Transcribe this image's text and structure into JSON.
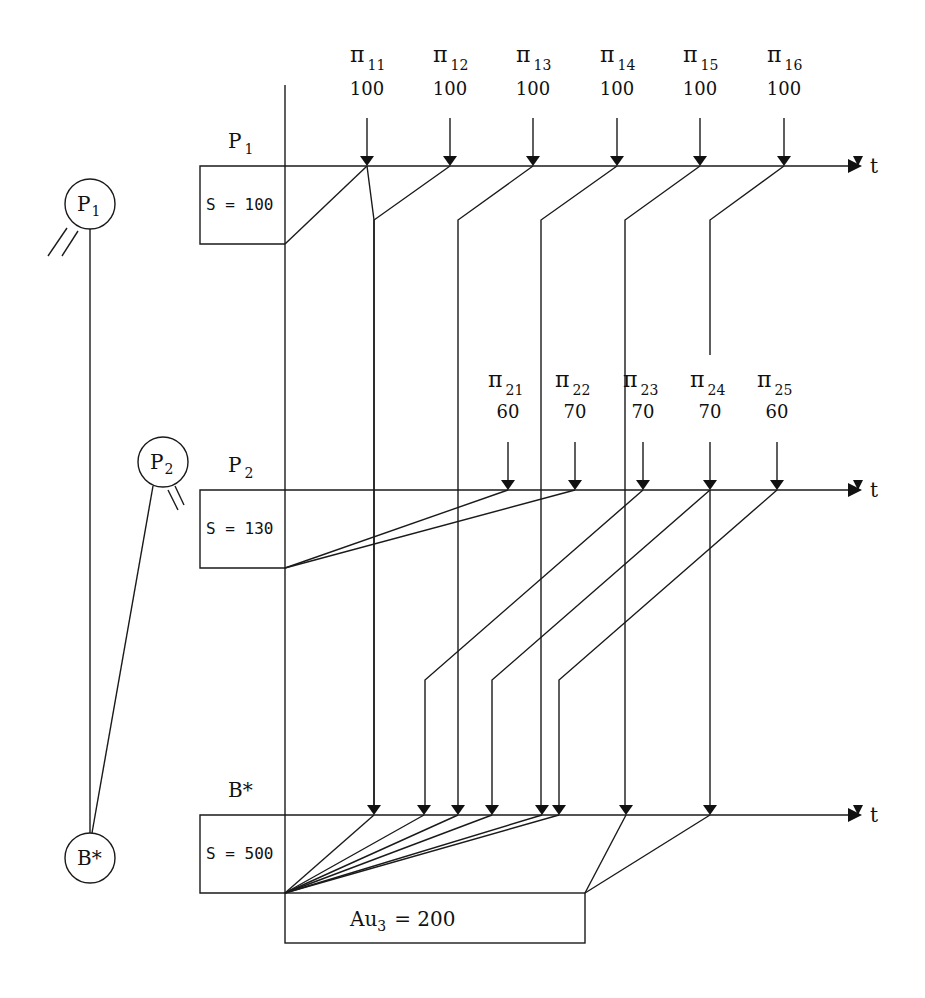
{
  "diagram": {
    "type": "payment-flow-timeline",
    "time_axis_label": "t",
    "nodes": [
      {
        "id": "P1",
        "label": "P",
        "sub": "1",
        "cx": 90,
        "cy": 204,
        "r": 25
      },
      {
        "id": "P2",
        "label": "P",
        "sub": "2",
        "cx": 163,
        "cy": 462,
        "r": 25
      },
      {
        "id": "B*",
        "label": "B*",
        "sub": "",
        "cx": 90,
        "cy": 858,
        "r": 25
      }
    ],
    "lanes": [
      {
        "id": "P1",
        "label": "P",
        "sub": "1",
        "y": 166,
        "stock_label": "S = 100",
        "stock_box": {
          "x": 200,
          "y": 166,
          "w": 85,
          "h": 78
        },
        "payments": [
          {
            "name": "π",
            "sub": "11",
            "value": "100",
            "x": 367
          },
          {
            "name": "π",
            "sub": "12",
            "value": "100",
            "x": 450
          },
          {
            "name": "π",
            "sub": "13",
            "value": "100",
            "x": 533
          },
          {
            "name": "π",
            "sub": "14",
            "value": "100",
            "x": 617
          },
          {
            "name": "π",
            "sub": "15",
            "value": "100",
            "x": 700
          },
          {
            "name": "π",
            "sub": "16",
            "value": "100",
            "x": 784
          }
        ]
      },
      {
        "id": "P2",
        "label": "P",
        "sub": "2",
        "y": 490,
        "stock_label": "S = 130",
        "stock_box": {
          "x": 200,
          "y": 490,
          "w": 85,
          "h": 78
        },
        "payments": [
          {
            "name": "π",
            "sub": "21",
            "value": "60",
            "x": 508
          },
          {
            "name": "π",
            "sub": "22",
            "value": "70",
            "x": 575
          },
          {
            "name": "π",
            "sub": "23",
            "value": "70",
            "x": 643
          },
          {
            "name": "π",
            "sub": "24",
            "value": "70",
            "x": 710
          },
          {
            "name": "π",
            "sub": "25",
            "value": "60",
            "x": 777
          }
        ]
      },
      {
        "id": "B*",
        "label": "B*",
        "sub": "",
        "y": 815,
        "stock_label": "S = 500",
        "stock_box": {
          "x": 200,
          "y": 815,
          "w": 85,
          "h": 78
        },
        "arrivals_x": [
          374,
          424,
          458,
          492,
          542,
          559,
          626,
          710
        ]
      }
    ],
    "overdraft": {
      "label": "Au",
      "sub": "3",
      "value": "= 200",
      "box": {
        "x": 285,
        "y": 893,
        "w": 300,
        "h": 50
      }
    }
  }
}
